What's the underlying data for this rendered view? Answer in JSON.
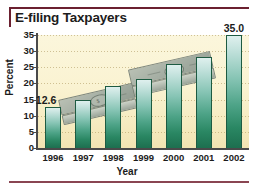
{
  "chart_data": {
    "type": "bar",
    "title": "E-filing Taxpayers",
    "xlabel": "Year",
    "ylabel": "Percent",
    "categories": [
      "1996",
      "1997",
      "1998",
      "1999",
      "2000",
      "2001",
      "2002"
    ],
    "values": [
      12.6,
      14.8,
      19.2,
      21.4,
      26.1,
      28.3,
      35.0
    ],
    "point_labels": [
      "12.6",
      "",
      "",
      "",
      "",
      "",
      "35.0"
    ],
    "ylim": [
      0,
      35
    ],
    "yticks": [
      0,
      5,
      10,
      15,
      20,
      25,
      30,
      35
    ],
    "ytick_labels": [
      "0",
      "5",
      "10",
      "15",
      "20",
      "25",
      "30",
      "35"
    ],
    "grid": true,
    "legend": false,
    "bar_color": "#2a8763",
    "plot_background": "#faf3d2",
    "accent_color": "#6b2030"
  },
  "figure": {
    "title": "E-filing Taxpayers"
  },
  "background_art": {
    "name": "dollar-bill-stacks",
    "count": 2
  }
}
